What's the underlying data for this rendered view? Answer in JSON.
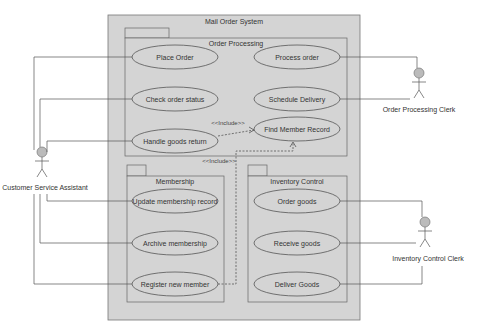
{
  "system": {
    "title": "Mail Order System",
    "fill": "#d4d4d4",
    "stroke": "#777777"
  },
  "packages": {
    "order_processing": {
      "title": "Order Processing"
    },
    "membership": {
      "title": "Membership"
    },
    "inventory": {
      "title": "Inventory Control"
    }
  },
  "use_cases": {
    "place_order": "Place Order",
    "process_order": "Process order",
    "check_status": "Check order status",
    "schedule_delivery": "Schedule Delivery",
    "handle_return": "Handle goods return",
    "find_member": "Find Member Record",
    "update_membership": "Update membership record",
    "archive_membership": "Archive membership",
    "register_member": "Register new member",
    "order_goods": "Order goods",
    "receive_goods": "Receive goods",
    "deliver_goods": "Deliver Goods"
  },
  "relations": {
    "include_1": "<<Include>>",
    "include_2": "<<Include>>"
  },
  "actors": {
    "csa": "Customer Service Assistant",
    "opc": "Order Processing Clerk",
    "icc": "Inventory Control Clerk"
  }
}
